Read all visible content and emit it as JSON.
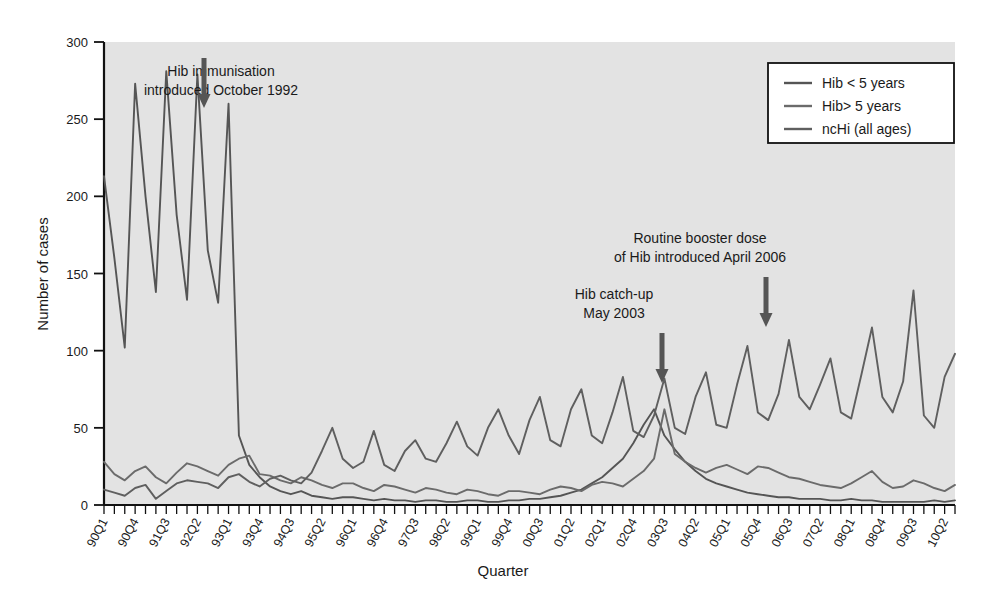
{
  "chart_data": {
    "type": "line",
    "title": "",
    "xlabel": "Quarter",
    "ylabel": "Number of cases",
    "ylim": [
      0,
      300
    ],
    "yticks": [
      0,
      50,
      100,
      150,
      200,
      250,
      300
    ],
    "grid": false,
    "legend_position": "top-right",
    "plot_background": "#e3e3e3",
    "line_color": "#4a4a4a",
    "categories": [
      "90Q1",
      "90Q2",
      "90Q3",
      "90Q4",
      "91Q1",
      "91Q2",
      "91Q3",
      "91Q4",
      "92Q1",
      "92Q2",
      "92Q3",
      "92Q4",
      "93Q1",
      "93Q2",
      "93Q3",
      "93Q4",
      "94Q1",
      "94Q2",
      "94Q3",
      "94Q4",
      "95Q1",
      "95Q2",
      "95Q3",
      "95Q4",
      "96Q1",
      "96Q2",
      "96Q3",
      "96Q4",
      "97Q1",
      "97Q2",
      "97Q3",
      "97Q4",
      "98Q1",
      "98Q2",
      "98Q3",
      "98Q4",
      "99Q1",
      "99Q2",
      "99Q3",
      "99Q4",
      "00Q1",
      "00Q2",
      "00Q3",
      "00Q4",
      "01Q1",
      "01Q2",
      "01Q3",
      "01Q4",
      "02Q1",
      "02Q2",
      "02Q3",
      "02Q4",
      "03Q1",
      "03Q2",
      "03Q3",
      "03Q4",
      "04Q1",
      "04Q2",
      "04Q3",
      "04Q4",
      "05Q1",
      "05Q2",
      "05Q3",
      "05Q4",
      "06Q1",
      "06Q2",
      "06Q3",
      "06Q4",
      "07Q1",
      "07Q2",
      "07Q3",
      "07Q4",
      "08Q1",
      "08Q2",
      "08Q3",
      "08Q4",
      "09Q1",
      "09Q2",
      "09Q3",
      "09Q4",
      "10Q1",
      "10Q2",
      "10Q3"
    ],
    "xtick_labels": [
      "90Q1",
      "90Q4",
      "91Q3",
      "92Q2",
      "93Q1",
      "93Q4",
      "94Q3",
      "95Q2",
      "96Q1",
      "96Q4",
      "97Q3",
      "98Q2",
      "99Q1",
      "99Q4",
      "00Q3",
      "01Q2",
      "02Q1",
      "02Q4",
      "03Q3",
      "04Q2",
      "05Q1",
      "05Q4",
      "06Q3",
      "07Q2",
      "08Q1",
      "08Q4",
      "09Q3",
      "10Q2"
    ],
    "xtick_indices": [
      0,
      3,
      6,
      9,
      12,
      15,
      18,
      21,
      24,
      27,
      30,
      33,
      36,
      39,
      42,
      45,
      48,
      51,
      54,
      57,
      60,
      63,
      66,
      69,
      72,
      75,
      78,
      81
    ],
    "series": [
      {
        "name": "Hib < 5 years",
        "values": [
          213,
          160,
          102,
          273,
          200,
          138,
          281,
          188,
          133,
          279,
          165,
          131,
          260,
          45,
          26,
          18,
          12,
          9,
          7,
          9,
          6,
          5,
          4,
          5,
          5,
          4,
          3,
          4,
          3,
          3,
          2,
          3,
          3,
          2,
          2,
          3,
          3,
          2,
          2,
          3,
          3,
          4,
          4,
          5,
          6,
          8,
          10,
          14,
          18,
          24,
          30,
          40,
          52,
          62,
          45,
          36,
          28,
          22,
          17,
          14,
          12,
          10,
          8,
          7,
          6,
          5,
          5,
          4,
          4,
          4,
          3,
          3,
          4,
          3,
          3,
          2,
          2,
          2,
          2,
          2,
          3,
          2,
          3
        ]
      },
      {
        "name": "Hib> 5 years",
        "values": [
          28,
          20,
          16,
          22,
          25,
          18,
          14,
          21,
          27,
          25,
          22,
          19,
          26,
          30,
          32,
          20,
          19,
          16,
          14,
          18,
          16,
          13,
          11,
          14,
          14,
          11,
          9,
          13,
          12,
          10,
          8,
          11,
          10,
          8,
          7,
          10,
          9,
          7,
          6,
          9,
          9,
          8,
          7,
          10,
          12,
          11,
          9,
          13,
          15,
          14,
          12,
          17,
          22,
          30,
          62,
          33,
          28,
          24,
          21,
          24,
          26,
          23,
          20,
          25,
          24,
          21,
          18,
          17,
          15,
          13,
          12,
          11,
          14,
          18,
          22,
          15,
          11,
          12,
          16,
          14,
          11,
          9,
          13
        ]
      },
      {
        "name": "ncHi (all ages)",
        "values": [
          10,
          8,
          6,
          11,
          13,
          4,
          9,
          14,
          16,
          15,
          14,
          11,
          18,
          20,
          15,
          12,
          17,
          19,
          16,
          14,
          21,
          35,
          50,
          30,
          24,
          28,
          48,
          26,
          22,
          35,
          42,
          30,
          28,
          40,
          54,
          38,
          32,
          50,
          62,
          45,
          33,
          55,
          70,
          42,
          38,
          62,
          75,
          45,
          40,
          60,
          83,
          48,
          44,
          58,
          82,
          50,
          46,
          70,
          86,
          52,
          50,
          78,
          103,
          60,
          55,
          72,
          107,
          70,
          62,
          78,
          95,
          60,
          56,
          85,
          115,
          70,
          60,
          80,
          139,
          58,
          50,
          83,
          98
        ]
      }
    ],
    "annotations": [
      {
        "id": "hib-immunisation",
        "lines": [
          "Hib immunisation",
          "introduced October 1992"
        ],
        "text_x": 221,
        "text_y": 76,
        "arrow_x": 204,
        "arrow_top": 58,
        "arrow_bottom": 108
      },
      {
        "id": "hib-catch-up",
        "lines": [
          "Hib catch-up",
          "May 2003"
        ],
        "text_x": 614,
        "text_y": 299,
        "arrow_x": 662,
        "arrow_top": 333,
        "arrow_bottom": 383
      },
      {
        "id": "routine-booster",
        "lines": [
          "Routine booster dose",
          "of Hib introduced April 2006"
        ],
        "text_x": 700,
        "text_y": 243,
        "arrow_x": 766,
        "arrow_top": 277,
        "arrow_bottom": 327
      }
    ]
  },
  "legend": {
    "entries": [
      {
        "label": "Hib < 5 years",
        "color": "#555555"
      },
      {
        "label": "Hib> 5 years",
        "color": "#6b6b6b"
      },
      {
        "label": "ncHi (all ages)",
        "color": "#5f5f5f"
      }
    ]
  }
}
